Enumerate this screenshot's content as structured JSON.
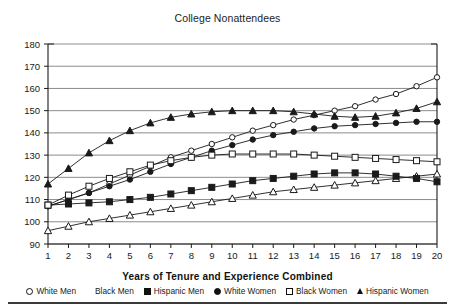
{
  "chart_data": {
    "type": "line",
    "title": "College Nonattendees",
    "xlabel": "Years of Tenure and Experience Combined",
    "ylabel": "",
    "x": [
      1,
      2,
      3,
      4,
      5,
      6,
      7,
      8,
      9,
      10,
      11,
      12,
      13,
      14,
      15,
      16,
      17,
      18,
      19,
      20
    ],
    "xlim": [
      1,
      20
    ],
    "ylim": [
      90,
      180
    ],
    "ytick_step": 10,
    "yticks": [
      90,
      100,
      110,
      120,
      130,
      140,
      150,
      160,
      170,
      180
    ],
    "xticks": [
      1,
      2,
      3,
      4,
      5,
      6,
      7,
      8,
      9,
      10,
      11,
      12,
      13,
      14,
      15,
      16,
      17,
      18,
      19,
      20
    ],
    "grid": "horizontal",
    "legend_position": "bottom",
    "series": [
      {
        "name": "White Men",
        "marker": "open-circle",
        "values": [
          107,
          110,
          113,
          117,
          121,
          125,
          129,
          132,
          135,
          138,
          141,
          143.5,
          146,
          148,
          150,
          152,
          155,
          157.5,
          161,
          165
        ]
      },
      {
        "name": "Black Men",
        "marker": "open-triangle",
        "values": [
          96,
          98,
          100,
          101.5,
          103,
          104.5,
          106,
          107.5,
          109,
          110.5,
          112,
          113.5,
          114.5,
          115.5,
          116.5,
          117.5,
          118.5,
          119.5,
          120.5,
          121.5
        ]
      },
      {
        "name": "Hispanic Men",
        "marker": "filled-square",
        "values": [
          107.5,
          108,
          108.5,
          109,
          110,
          111,
          112.5,
          114,
          115.5,
          117,
          118.5,
          119.5,
          120.5,
          121.5,
          122,
          122,
          121.5,
          120.5,
          119.5,
          118
        ]
      },
      {
        "name": "White Women",
        "marker": "filled-circle",
        "values": [
          107,
          110,
          113,
          116,
          119,
          122.5,
          126,
          129,
          132,
          134.5,
          137,
          139,
          140.5,
          142,
          143,
          143.5,
          144,
          144.5,
          145,
          145
        ]
      },
      {
        "name": "Black Women",
        "marker": "open-square",
        "values": [
          107.5,
          112,
          116,
          119.5,
          122.5,
          125.5,
          127.5,
          129,
          130,
          130.5,
          130.5,
          130.5,
          130.5,
          130,
          129.5,
          129,
          128.5,
          128,
          127.5,
          127
        ]
      },
      {
        "name": "Hispanic Women",
        "marker": "filled-triangle",
        "values": [
          117,
          124,
          131,
          136.5,
          141,
          144.5,
          147,
          148.5,
          149.5,
          150,
          150,
          150,
          149.5,
          148.5,
          147.5,
          147,
          147.5,
          149,
          151,
          154
        ]
      }
    ]
  },
  "legend": {
    "items": [
      {
        "label": "White Men",
        "marker": "open-circle"
      },
      {
        "label": "Black Men",
        "marker": "open-triangle"
      },
      {
        "label": "Hispanic Men",
        "marker": "filled-square"
      },
      {
        "label": "White Women",
        "marker": "filled-circle"
      },
      {
        "label": "Black Women",
        "marker": "open-square"
      },
      {
        "label": "Hispanic Women",
        "marker": "filled-triangle"
      }
    ]
  },
  "colors": {
    "line": "#1a1a1a",
    "grid": "#8c8c8c",
    "axis": "#1a1a1a",
    "background": "#ffffff",
    "text": "#1a1a1a"
  }
}
